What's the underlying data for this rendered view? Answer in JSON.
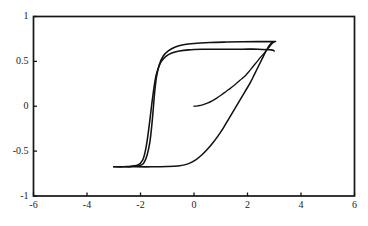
{
  "figure": {
    "width": 368,
    "height": 226,
    "background_color": "#ffffff",
    "axis_color": "#151515",
    "curve_color": "#121212"
  },
  "chart_data": {
    "type": "line",
    "title": "",
    "subtitle": "",
    "xlabel": "",
    "ylabel": "",
    "xlim": [
      -6,
      6
    ],
    "ylim": [
      -1,
      1
    ],
    "grid": false,
    "legend": null,
    "legend_position": "none",
    "annotations": [],
    "xticks": [
      -6,
      -4,
      -2,
      0,
      2,
      4,
      6
    ],
    "xticklabels": [
      "-6",
      "-4",
      "-2",
      "0",
      "2",
      "4",
      "6"
    ],
    "yticks": [
      -1,
      -0.5,
      0,
      0.5,
      1
    ],
    "yticklabels": [
      "-1",
      "-0.5",
      "0",
      "0.5",
      "1"
    ],
    "series": [
      {
        "name": "major-loop-outer",
        "saturation_positive": 0.72,
        "saturation_negative": -0.68,
        "coercivity": 1.6,
        "remanence": 0.58,
        "points": [
          [
            -3.0,
            -0.675
          ],
          [
            -2.6,
            -0.675
          ],
          [
            -2.2,
            -0.672
          ],
          [
            -1.9,
            -0.64
          ],
          [
            -1.75,
            -0.54
          ],
          [
            -1.65,
            -0.4
          ],
          [
            -1.58,
            -0.22
          ],
          [
            -1.52,
            -0.02
          ],
          [
            -1.47,
            0.16
          ],
          [
            -1.4,
            0.33
          ],
          [
            -1.3,
            0.46
          ],
          [
            -1.15,
            0.56
          ],
          [
            -0.95,
            0.62
          ],
          [
            -0.7,
            0.66
          ],
          [
            -0.4,
            0.685
          ],
          [
            0.0,
            0.7
          ],
          [
            0.6,
            0.71
          ],
          [
            1.2,
            0.715
          ],
          [
            1.8,
            0.718
          ],
          [
            2.4,
            0.72
          ],
          [
            3.0,
            0.72
          ],
          [
            3.0,
            0.72
          ],
          [
            2.85,
            0.69
          ],
          [
            2.7,
            0.62
          ],
          [
            2.55,
            0.53
          ],
          [
            2.4,
            0.44
          ],
          [
            2.25,
            0.35
          ],
          [
            2.1,
            0.26
          ],
          [
            1.9,
            0.16
          ],
          [
            1.7,
            0.06
          ],
          [
            1.5,
            -0.04
          ],
          [
            1.3,
            -0.14
          ],
          [
            1.1,
            -0.24
          ],
          [
            0.9,
            -0.33
          ],
          [
            0.7,
            -0.41
          ],
          [
            0.5,
            -0.48
          ],
          [
            0.3,
            -0.54
          ],
          [
            0.05,
            -0.6
          ],
          [
            -0.25,
            -0.645
          ],
          [
            -0.6,
            -0.665
          ],
          [
            -1.0,
            -0.672
          ],
          [
            -1.6,
            -0.675
          ],
          [
            -2.2,
            -0.675
          ],
          [
            -3.0,
            -0.675
          ]
        ]
      },
      {
        "name": "major-loop-inner",
        "saturation_positive": 0.635,
        "saturation_negative": -0.675,
        "coercivity": 1.55,
        "remanence": 0.54,
        "points": [
          [
            -3.0,
            -0.675
          ],
          [
            -2.5,
            -0.672
          ],
          [
            -2.1,
            -0.655
          ],
          [
            -1.92,
            -0.6
          ],
          [
            -1.82,
            -0.5
          ],
          [
            -1.74,
            -0.36
          ],
          [
            -1.66,
            -0.18
          ],
          [
            -1.58,
            0.02
          ],
          [
            -1.5,
            0.2
          ],
          [
            -1.42,
            0.34
          ],
          [
            -1.33,
            0.43
          ],
          [
            -1.22,
            0.5
          ],
          [
            -1.05,
            0.555
          ],
          [
            -0.85,
            0.59
          ],
          [
            -0.55,
            0.615
          ],
          [
            -0.2,
            0.628
          ],
          [
            0.3,
            0.634
          ],
          [
            1.0,
            0.636
          ],
          [
            1.8,
            0.636
          ],
          [
            2.4,
            0.636
          ],
          [
            2.9,
            0.628
          ],
          [
            3.0,
            0.615
          ]
        ]
      },
      {
        "name": "virgin-curve",
        "start": [
          0,
          0
        ],
        "points": [
          [
            0.0,
            0.0
          ],
          [
            0.15,
            0.005
          ],
          [
            0.32,
            0.015
          ],
          [
            0.5,
            0.035
          ],
          [
            0.68,
            0.06
          ],
          [
            0.85,
            0.09
          ],
          [
            1.02,
            0.125
          ],
          [
            1.2,
            0.165
          ],
          [
            1.38,
            0.205
          ],
          [
            1.55,
            0.245
          ],
          [
            1.72,
            0.29
          ],
          [
            1.9,
            0.335
          ],
          [
            2.05,
            0.385
          ],
          [
            2.2,
            0.44
          ],
          [
            2.35,
            0.495
          ],
          [
            2.5,
            0.55
          ],
          [
            2.65,
            0.6
          ],
          [
            2.8,
            0.655
          ],
          [
            2.92,
            0.7
          ],
          [
            3.0,
            0.72
          ]
        ]
      }
    ]
  }
}
